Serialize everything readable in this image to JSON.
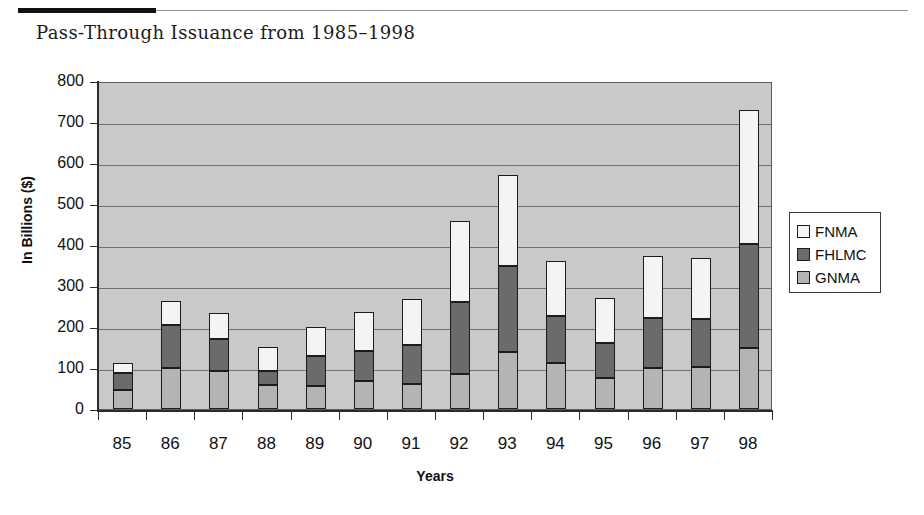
{
  "figure": {
    "title": "Pass-Through Issuance from 1985–1998"
  },
  "legend": {
    "position": "right",
    "items": [
      {
        "label": "FNMA",
        "color": "#f4f4f4"
      },
      {
        "label": "FHLMC",
        "color": "#6b6b6b"
      },
      {
        "label": "GNMA",
        "color": "#b4b4b4"
      }
    ]
  },
  "axes": {
    "y_title": "In Billions ($)",
    "x_title": "Years",
    "y_ticks": [
      "0",
      "100",
      "200",
      "300",
      "400",
      "500",
      "600",
      "700",
      "800"
    ],
    "x_ticks": [
      "85",
      "86",
      "87",
      "88",
      "89",
      "90",
      "91",
      "92",
      "93",
      "94",
      "95",
      "96",
      "97",
      "98"
    ]
  },
  "colors": {
    "plot_background": "#c9c9c9",
    "gridline": "#6f6f6f",
    "axis": "#2b2b2b",
    "bar_outline": "#1c1c1c",
    "rule": "#111111"
  },
  "chart_data": {
    "type": "bar",
    "stacked": true,
    "title": "Pass-Through Issuance from 1985–1998",
    "xlabel": "Years",
    "ylabel": "In Billions ($)",
    "ylim": [
      0,
      800
    ],
    "ytick_step": 100,
    "grid": true,
    "legend_position": "right",
    "categories": [
      "85",
      "86",
      "87",
      "88",
      "89",
      "90",
      "91",
      "92",
      "93",
      "94",
      "95",
      "96",
      "97",
      "98"
    ],
    "series": [
      {
        "name": "GNMA",
        "color": "#b4b4b4",
        "values": [
          46,
          100,
          93,
          58,
          57,
          68,
          62,
          85,
          138,
          112,
          75,
          100,
          103,
          150
        ]
      },
      {
        "name": "FHLMC",
        "color": "#6b6b6b",
        "values": [
          42,
          105,
          77,
          35,
          73,
          74,
          93,
          177,
          212,
          116,
          85,
          122,
          117,
          253
        ]
      },
      {
        "name": "FNMA",
        "color": "#f4f4f4",
        "values": [
          24,
          58,
          63,
          59,
          70,
          94,
          113,
          196,
          220,
          132,
          110,
          150,
          148,
          327
        ]
      }
    ],
    "cumulative_tops": {
      "GNMA": [
        46,
        100,
        93,
        58,
        57,
        68,
        62,
        85,
        138,
        112,
        75,
        100,
        103,
        150
      ],
      "FHLMC": [
        88,
        205,
        170,
        93,
        130,
        142,
        155,
        262,
        350,
        228,
        160,
        222,
        220,
        403
      ],
      "FNMA": [
        112,
        263,
        233,
        152,
        200,
        236,
        268,
        458,
        570,
        360,
        270,
        372,
        368,
        730
      ]
    },
    "totals": [
      112,
      263,
      233,
      152,
      200,
      236,
      268,
      458,
      570,
      360,
      270,
      372,
      368,
      730
    ]
  }
}
